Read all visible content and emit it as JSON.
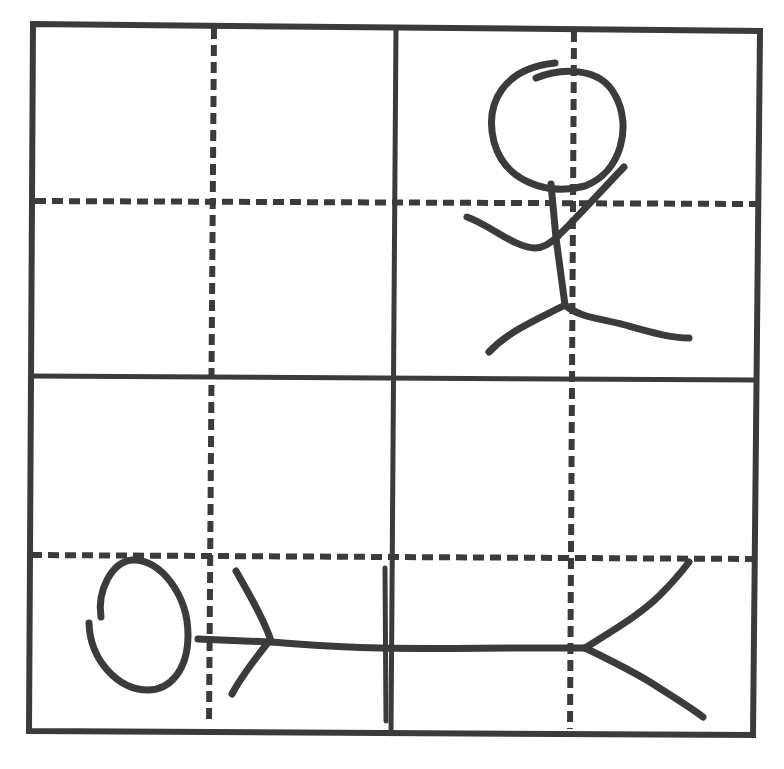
{
  "figure": {
    "stroke_color": "#3b3b3b",
    "background_color": "#ffffff",
    "grid": {
      "outer_border": "solid",
      "major_dividers": "solid",
      "minor_dividers": "dashed",
      "rows": 4,
      "cols": 4
    },
    "figures": [
      {
        "name": "standing-stick-figure",
        "position": "top-right quadrant",
        "pose": "upright, one arm raised"
      },
      {
        "name": "lying-stick-figure",
        "position": "bottom row, spanning left to right",
        "pose": "horizontal, head on left"
      }
    ]
  }
}
